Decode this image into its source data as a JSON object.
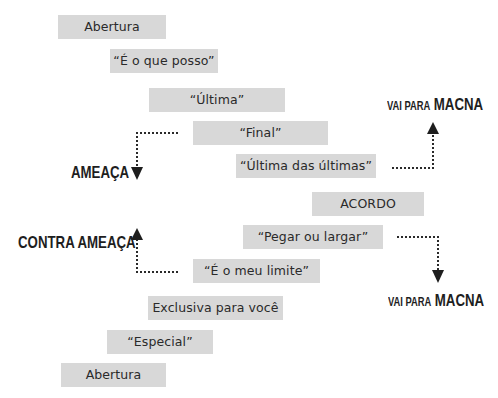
{
  "diagram": {
    "steps": [
      {
        "id": "abertura-top",
        "label": "Abertura"
      },
      {
        "id": "e-o-que-posso",
        "label": "“É o que posso”"
      },
      {
        "id": "ultima",
        "label": "“Última”"
      },
      {
        "id": "final",
        "label": "“Final”"
      },
      {
        "id": "ultima-das-ultimas",
        "label": "“Última das últimas”"
      },
      {
        "id": "acordo",
        "label": "ACORDO"
      },
      {
        "id": "pegar-ou-largar",
        "label": "“Pegar ou largar”"
      },
      {
        "id": "e-o-meu-limite",
        "label": "“É o meu limite”"
      },
      {
        "id": "exclusiva",
        "label": "Exclusiva para você"
      },
      {
        "id": "especial",
        "label": "“Especial”"
      },
      {
        "id": "abertura-bottom",
        "label": "Abertura"
      }
    ],
    "outcomes": {
      "ameaca": "AMEAÇA",
      "contra_ameaca": "CONTRA AMEAÇA",
      "macna_top": {
        "prefix": "VAI PARA",
        "emphasis": "MACNA"
      },
      "macna_bottom": {
        "prefix": "VAI PARA",
        "emphasis": "MACNA"
      }
    },
    "connections": [
      {
        "from": "final",
        "to": "ameaca",
        "direction": "down"
      },
      {
        "from": "e-o-meu-limite",
        "to": "contra_ameaca",
        "direction": "up"
      },
      {
        "from": "ultima-das-ultimas",
        "to": "macna_top",
        "direction": "up"
      },
      {
        "from": "pegar-ou-largar",
        "to": "macna_bottom",
        "direction": "down"
      }
    ]
  }
}
